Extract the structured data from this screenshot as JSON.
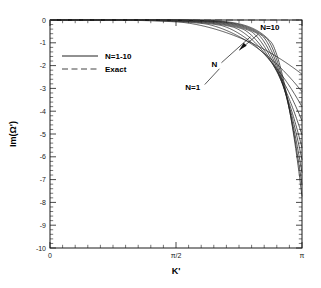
{
  "chart_data": {
    "type": "line",
    "title": "",
    "xlabel": "K'",
    "ylabel": "Im(Ω')",
    "xlim": [
      0,
      3.14159265
    ],
    "ylim": [
      -10,
      0
    ],
    "grid": false,
    "x_tick_labels": [
      "0",
      "π/2",
      "π"
    ],
    "x_tick_values": [
      0,
      1.5707963,
      3.14159265
    ],
    "y_tick_labels": [
      "0",
      "-1",
      "-2",
      "-3",
      "-4",
      "-5",
      "-6",
      "-7",
      "-8",
      "-9",
      "-10"
    ],
    "y_tick_values": [
      0,
      -1,
      -2,
      -3,
      -4,
      -5,
      -6,
      -7,
      -8,
      -9,
      -10
    ],
    "x_minor_ticks_per_interval": 10,
    "y_minor_ticks_per_interval": 5,
    "legend": {
      "position": "upper-left-inside",
      "entries": [
        {
          "label": "N=1-10",
          "style": "solid"
        },
        {
          "label": "Exact",
          "style": "dashed"
        }
      ]
    },
    "annotations": [
      {
        "text": "N=10",
        "x": 2.62,
        "y": -0.45,
        "leader": "arrow-down-left"
      },
      {
        "text": "N",
        "x": 2.05,
        "y": -2.05,
        "leader": "line-up-right"
      },
      {
        "text": "N=1",
        "x": 1.78,
        "y": -3.05,
        "leader": "line-up-right"
      }
    ],
    "exact_series": {
      "name": "Exact",
      "style": "dashed",
      "x": [
        0,
        3.14159265
      ],
      "values": [
        0,
        0
      ]
    },
    "series": [
      {
        "name": "N=1",
        "endpoint_y": -2.95,
        "knee_x": 1.62,
        "sharpness": 1.35
      },
      {
        "name": "N=2",
        "endpoint_y": -3.9,
        "knee_x": 1.92,
        "sharpness": 1.75
      },
      {
        "name": "N=3",
        "endpoint_y": -4.72,
        "knee_x": 2.12,
        "sharpness": 2.15
      },
      {
        "name": "N=4",
        "endpoint_y": -5.48,
        "knee_x": 2.28,
        "sharpness": 2.55
      },
      {
        "name": "N=5",
        "endpoint_y": -6.25,
        "knee_x": 2.4,
        "sharpness": 2.95
      },
      {
        "name": "N=6",
        "endpoint_y": -6.95,
        "knee_x": 2.5,
        "sharpness": 3.35
      },
      {
        "name": "N=7",
        "endpoint_y": -7.6,
        "knee_x": 2.58,
        "sharpness": 3.75
      },
      {
        "name": "N=8",
        "endpoint_y": -8.3,
        "knee_x": 2.65,
        "sharpness": 4.15
      },
      {
        "name": "N=9",
        "endpoint_y": -8.98,
        "knee_x": 2.71,
        "sharpness": 4.55
      },
      {
        "name": "N=10",
        "endpoint_y": -9.6,
        "knee_x": 2.76,
        "sharpness": 4.95
      }
    ]
  }
}
